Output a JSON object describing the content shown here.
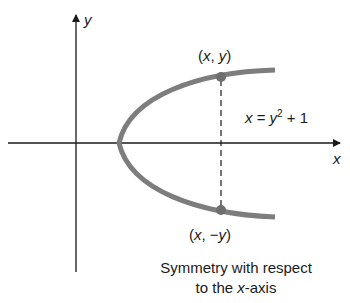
{
  "diagram": {
    "axis_labels": {
      "x": "x",
      "y": "y"
    },
    "points": [
      {
        "id": "upper",
        "label_open": "(",
        "label_var1": "x",
        "label_sep": ", ",
        "label_var2": "y",
        "label_close": ")"
      },
      {
        "id": "lower",
        "label_open": "(",
        "label_var1": "x",
        "label_sep": ", ",
        "label_neg": "−",
        "label_var2": "y",
        "label_close": ")"
      }
    ],
    "equation": {
      "lhs": "x",
      "eq": " = ",
      "var": "y",
      "exp": "2",
      "rest": " + 1"
    },
    "caption": {
      "line1": "Symmetry with respect",
      "line2_pre": "to the ",
      "line2_var": "x",
      "line2_post": "-axis"
    },
    "colors": {
      "curve": "#7d7d7d",
      "axis": "#1a1a1a",
      "point": "#6e6e6e"
    }
  }
}
